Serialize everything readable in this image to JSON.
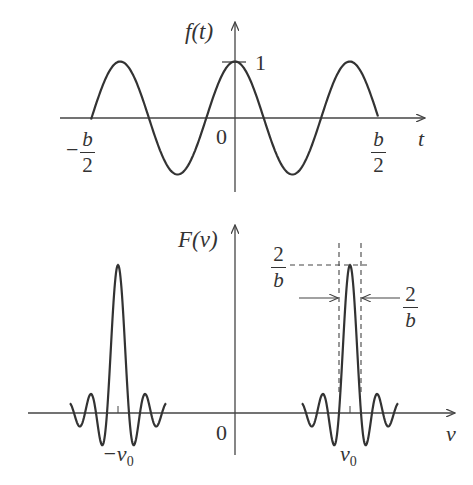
{
  "top_plot": {
    "ylabel": "f(t)",
    "xlabel": "t",
    "origin_label": "0",
    "peak_label": "1",
    "left_limit": {
      "sign": "−",
      "num": "b",
      "den": "2"
    },
    "right_limit": {
      "num": "b",
      "den": "2"
    }
  },
  "bottom_plot": {
    "ylabel": "F(v)",
    "xlabel": "v",
    "origin_label": "0",
    "neg_center_label": "−v",
    "neg_center_sub": "0",
    "pos_center_label": "v",
    "pos_center_sub": "0",
    "height_label": {
      "num": "2",
      "den": "b"
    },
    "width_label": {
      "num": "2",
      "den": "b"
    }
  },
  "chart_data": [
    {
      "type": "line",
      "title": "",
      "xlabel": "t",
      "ylabel": "f(t)",
      "description": "Truncated cosine f(t)=cos(2πv0 t) for |t|<b/2, 2.5 periods shown",
      "x_ticks": [
        "-b/2",
        "0",
        "b/2"
      ],
      "y_ticks": [
        "1"
      ],
      "ylim": [
        -1,
        1
      ]
    },
    {
      "type": "line",
      "title": "",
      "xlabel": "v",
      "ylabel": "F(v)",
      "description": "Two sinc-shaped peaks centered at -v0 and v0, each of height 2/b... width 2/b",
      "x_ticks": [
        "-v0",
        "0",
        "v0"
      ],
      "annotations": [
        "2/b (height)",
        "2/b (width)"
      ]
    }
  ]
}
